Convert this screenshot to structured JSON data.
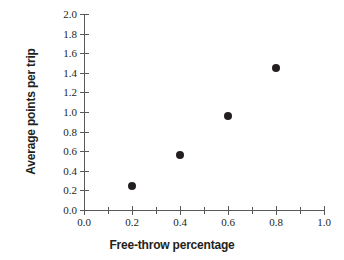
{
  "chart_data": {
    "type": "scatter",
    "title": "",
    "xlabel": "Free-throw percentage",
    "ylabel": "Average points per trip",
    "xlim": [
      0.0,
      1.0
    ],
    "ylim": [
      0.0,
      2.0
    ],
    "grid": false,
    "legend": null,
    "x": [
      0.2,
      0.4,
      0.6,
      0.8
    ],
    "y": [
      0.24,
      0.56,
      0.96,
      1.45
    ],
    "points": [
      {
        "x": 0.2,
        "y": 0.24
      },
      {
        "x": 0.4,
        "y": 0.56
      },
      {
        "x": 0.6,
        "y": 0.96
      },
      {
        "x": 0.8,
        "y": 1.45
      }
    ],
    "marker": {
      "shape": "circle",
      "filled": true,
      "color": "#231f20",
      "size_px": 8
    },
    "xticks": [
      0.0,
      0.2,
      0.4,
      0.6,
      0.8,
      1.0
    ],
    "xtick_labels": [
      "0.0",
      "0.2",
      "0.4",
      "0.6",
      "0.8",
      "1.0"
    ],
    "x_minor_ticks": [
      0.1,
      0.3,
      0.5,
      0.7,
      0.9
    ],
    "yticks": [
      0.0,
      0.2,
      0.4,
      0.6,
      0.8,
      1.0,
      1.2,
      1.4,
      1.6,
      1.8,
      2.0
    ],
    "ytick_labels": [
      "0.0",
      "0.2",
      "0.4",
      "0.6",
      "0.8",
      "1.0",
      "1.2",
      "1.4",
      "1.6",
      "1.8",
      "2.0"
    ],
    "axis_color": "#58595b",
    "text_color": "#231f20",
    "background": "#ffffff"
  }
}
